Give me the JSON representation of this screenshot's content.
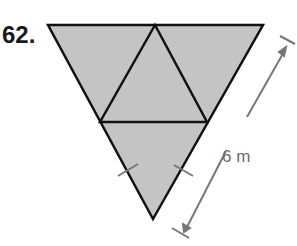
{
  "problem": {
    "number": "62."
  },
  "figure": {
    "dimension_label": "6 m",
    "fill_color": "#c4c4c4",
    "stroke_color": "#111111",
    "dimension_color": "#777777"
  }
}
